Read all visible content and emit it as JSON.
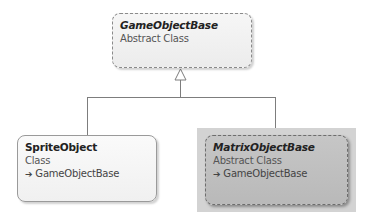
{
  "diagram": {
    "type": "class-diagram",
    "nodes": [
      {
        "id": "base",
        "name": "GameObjectBase",
        "kind": "Abstract Class",
        "abstract": true,
        "inherits": null
      },
      {
        "id": "sprite",
        "name": "SpriteObject",
        "kind": "Class",
        "abstract": false,
        "inherits": "GameObjectBase"
      },
      {
        "id": "matrix",
        "name": "MatrixObjectBase",
        "kind": "Abstract Class",
        "abstract": true,
        "inherits": "GameObjectBase",
        "selected": true
      }
    ],
    "edges": [
      {
        "from": "SpriteObject",
        "to": "GameObjectBase",
        "type": "inheritance"
      },
      {
        "from": "MatrixObjectBase",
        "to": "GameObjectBase",
        "type": "inheritance"
      }
    ],
    "inherit_arrow_icon": "➔"
  }
}
